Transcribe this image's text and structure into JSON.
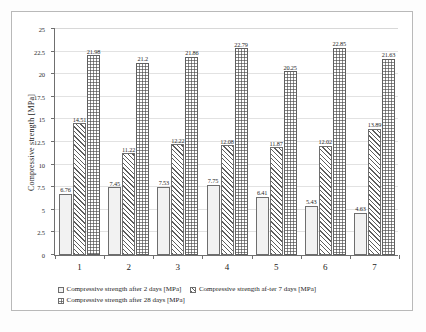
{
  "chart_data": {
    "type": "bar",
    "title": "",
    "subtitle": "",
    "xlabel": "",
    "ylabel": "Compressive  strength  [MPa]",
    "ylim": [
      0,
      25
    ],
    "yticks": [
      "0",
      "2.5",
      "5",
      "7.5",
      "10",
      "12.5",
      "15",
      "17.5",
      "20",
      "22.5",
      "25"
    ],
    "ytick_values": [
      0,
      2.5,
      5,
      7.5,
      10,
      12.5,
      15,
      17.5,
      20,
      22.5,
      25
    ],
    "grid": "horizontal",
    "legend_position": "bottom",
    "categories": [
      "1",
      "2",
      "3",
      "4",
      "5",
      "6",
      "7"
    ],
    "series": [
      {
        "name": "Compressive strength after 2 days  [MPa]",
        "pattern": "light-dotted",
        "color": "#f2f2f2",
        "values": [
          6.76,
          7.45,
          7.53,
          7.75,
          6.41,
          5.43,
          4.63
        ],
        "labels": [
          "6.76",
          "7.45",
          "7.53",
          "7.75",
          "6.41",
          "5.43",
          "4.63"
        ]
      },
      {
        "name": "Compressive strength af-ter 7 days  [MPa]",
        "pattern": "diagonal-hatch",
        "color": "#ffffff",
        "values": [
          14.51,
          11.22,
          12.22,
          12.08,
          11.87,
          12.02,
          13.89
        ],
        "labels": [
          "14.51",
          "11.22",
          "12.22",
          "12.08",
          "11.87",
          "12.02",
          "13.89"
        ]
      },
      {
        "name": "Compressive strength after 28 days [MPa]",
        "pattern": "dark-dotted",
        "color": "#8a8a8a",
        "values": [
          21.98,
          21.2,
          21.86,
          22.79,
          20.25,
          22.85,
          21.63
        ],
        "labels": [
          "21.98",
          "21.2",
          "21.86",
          "22.79",
          "20.25",
          "22.85",
          "21.63"
        ]
      }
    ]
  },
  "legend": {
    "items": [
      "Compressive strength after 2 days  [MPa]",
      "Compressive strength af-ter 7 days  [MPa]",
      "Compressive strength after 28 days [MPa]"
    ]
  }
}
